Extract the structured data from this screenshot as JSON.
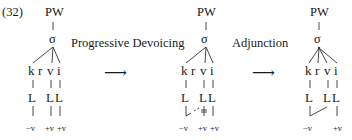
{
  "example_number": "(32)",
  "arrow_glyph": "⟶",
  "processes": [
    {
      "label": "Progressive Devoicing"
    },
    {
      "label": "Adjunction"
    }
  ],
  "representations": [
    {
      "id": "input",
      "prosodic_word": "PW",
      "syllable": "σ",
      "segments": [
        "k",
        "r",
        "v",
        "i"
      ],
      "laryngeal_row": [
        "L",
        "L",
        "L"
      ],
      "features": [
        "−v",
        "+v",
        "+v"
      ],
      "note": "k, v, i each linked to own L node"
    },
    {
      "id": "after-progressive-devoicing",
      "prosodic_word": "PW",
      "syllable": "σ",
      "segments": [
        "k",
        "r",
        "v",
        "i"
      ],
      "laryngeal_row": [
        "L",
        "L",
        "L"
      ],
      "features": [
        "−v",
        "+v",
        "+v"
      ],
      "note": "−v of k spreads (dashed) to L of v; v's +v link delinked"
    },
    {
      "id": "after-adjunction",
      "prosodic_word": "PW",
      "syllable": "σ",
      "segments": [
        "k",
        "r",
        "v",
        "i"
      ],
      "laryngeal_row": [
        "L",
        "L",
        "L"
      ],
      "features": [
        "−v",
        "+v"
      ],
      "note": "v adjoined directly to σ; −v shared by k and v"
    }
  ]
}
